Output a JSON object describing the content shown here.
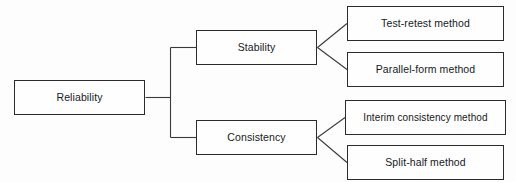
{
  "diagram": {
    "title": "Reliability",
    "type": "hierarchy-tree",
    "orientation": "left-to-right",
    "style": {
      "background_color": "#fdfdfd",
      "box_fill_color": "#fefefe",
      "box_border_color": "#2b2b2b",
      "connector_color": "#3a3a3a",
      "text_color": "#16191c"
    },
    "nodes": {
      "root": {
        "label": "Reliability",
        "level": 1
      },
      "branch_stability": {
        "label": "Stability",
        "level": 2
      },
      "branch_consistency": {
        "label": "Consistency",
        "level": 2
      },
      "leaf_test_retest": {
        "label": "Test-retest method",
        "level": 3,
        "parent": "Stability"
      },
      "leaf_parallel_form": {
        "label": "Parallel-form method",
        "level": 3,
        "parent": "Stability"
      },
      "leaf_interim_consistency": {
        "label": "Interim consistency method",
        "level": 3,
        "parent": "Consistency"
      },
      "leaf_split_half": {
        "label": "Split-half method",
        "level": 3,
        "parent": "Consistency"
      }
    }
  }
}
